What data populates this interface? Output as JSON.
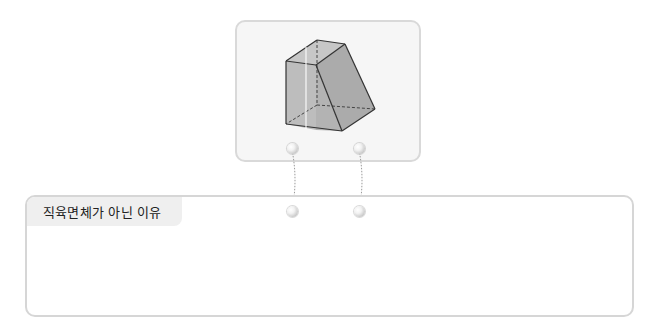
{
  "figure": {
    "face_fill": "#b9b9b9",
    "face_fill_dark": "#a9a9a9",
    "edge_color": "#3a3a3a",
    "card_background": "#f6f6f6",
    "card_border": "#d9d9d9"
  },
  "connectors": {
    "top_left": {
      "x": 292,
      "y": 148
    },
    "top_right": {
      "x": 359,
      "y": 148
    },
    "bottom_left": {
      "x": 292,
      "y": 211
    },
    "bottom_right": {
      "x": 359,
      "y": 211
    }
  },
  "answer": {
    "label": "직육면체가 아닌 이유",
    "value": "",
    "placeholder": ""
  }
}
